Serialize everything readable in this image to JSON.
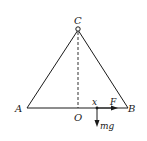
{
  "diagram": {
    "type": "physics-free-body",
    "labels": {
      "apex": "C",
      "left_vertex": "A",
      "right_vertex": "B",
      "foot": "O",
      "distance": "x",
      "force": "F",
      "weight": "mg"
    },
    "colors": {
      "stroke": "#1a1a1a",
      "background": "#ffffff"
    }
  }
}
